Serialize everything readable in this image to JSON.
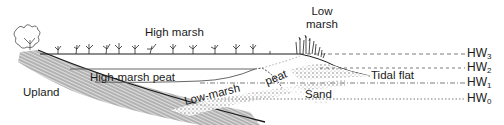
{
  "diagram": {
    "type": "salt-marsh-cross-section",
    "labels": {
      "high_marsh": "High marsh",
      "low_marsh_line1": "Low",
      "low_marsh_line2": "marsh",
      "high_marsh_peat": "High-marsh peat",
      "low_marsh_peat_part1": "Low-marsh",
      "low_marsh_peat_part2": "peat",
      "upland": "Upland",
      "sand": "Sand",
      "tidal_flat": "Tidal flat"
    },
    "water_levels": [
      {
        "base": "HW",
        "sub": "3",
        "y": 54
      },
      {
        "base": "HW",
        "sub": "2",
        "y": 68
      },
      {
        "base": "HW",
        "sub": "1",
        "y": 83
      },
      {
        "base": "HW",
        "sub": "0",
        "y": 99
      }
    ],
    "colors": {
      "ink": "#1a1a1a",
      "stipple": "#8a8a8a",
      "background": "#ffffff"
    }
  }
}
